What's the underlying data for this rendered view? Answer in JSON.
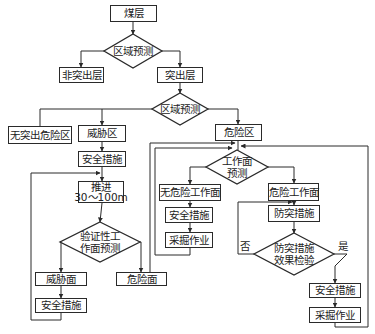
{
  "diagram": {
    "type": "flowchart",
    "nodes": {
      "coal_seam": "煤层",
      "regional_prediction_1": "区域预测",
      "non_outburst_seam": "非突出层",
      "outburst_seam": "突出层",
      "regional_prediction_2": "区域预测",
      "no_outburst_danger_zone": "无突出危险区",
      "threat_zone": "威胁区",
      "danger_zone": "危险区",
      "safety_measures_1": "安全措施",
      "advance_line1": "推进",
      "advance_line2": "30～100m",
      "verification_line1": "验证性工",
      "verification_line2": "作面预测",
      "threat_face": "威胁面",
      "danger_face": "危险面",
      "safety_measures_2": "安全措施",
      "face_prediction_line1": "工作面",
      "face_prediction_line2": "预测",
      "no_danger_face": "无危险工作面",
      "danger_working_face": "危险工作面",
      "safety_measures_3": "安全措施",
      "mining_1": "采掘作业",
      "outburst_prevention": "防突措施",
      "effect_check_line1": "防突措施",
      "effect_check_line2": "效果检验",
      "safety_measures_4": "安全措施",
      "mining_2": "采掘作业"
    },
    "edge_labels": {
      "no": "否",
      "yes": "是"
    },
    "line_color": "#2a2a2a"
  }
}
